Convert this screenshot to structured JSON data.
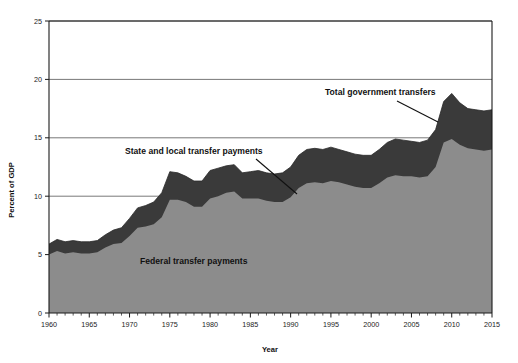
{
  "chart_data": {
    "type": "area",
    "stacked": true,
    "title": "",
    "subtitle": "",
    "xlabel": "Year",
    "ylabel": "Percent of GDP",
    "xlim": [
      1960,
      2015
    ],
    "ylim": [
      0,
      25
    ],
    "y_ticks": [
      0,
      5,
      10,
      15,
      20,
      25
    ],
    "x_ticks": [
      1960,
      1965,
      1970,
      1975,
      1980,
      1985,
      1990,
      1995,
      2000,
      2005,
      2010,
      2015
    ],
    "x_tick_labels": [
      "1960",
      "1965",
      "1970",
      "1975",
      "1980",
      "1985",
      "1990",
      "1995",
      "2000",
      "2005",
      "2010",
      "2015"
    ],
    "y_tick_labels": [
      "0",
      "5",
      "10",
      "15",
      "20",
      "25"
    ],
    "x_minor_tick_interval": 1,
    "grid": "horizontal",
    "legend": "inline-annotations",
    "colors": {
      "federal": "#8c8c8c",
      "state_local": "#3a3a3a",
      "axis": "#1a1a1a",
      "gridline": "#555555",
      "background": "#ffffff"
    },
    "x": [
      1960,
      1961,
      1962,
      1963,
      1964,
      1965,
      1966,
      1967,
      1968,
      1969,
      1970,
      1971,
      1972,
      1973,
      1974,
      1975,
      1976,
      1977,
      1978,
      1979,
      1980,
      1981,
      1982,
      1983,
      1984,
      1985,
      1986,
      1987,
      1988,
      1989,
      1990,
      1991,
      1992,
      1993,
      1994,
      1995,
      1996,
      1997,
      1998,
      1999,
      2000,
      2001,
      2002,
      2003,
      2004,
      2005,
      2006,
      2007,
      2008,
      2009,
      2010,
      2011,
      2012,
      2013,
      2014,
      2015
    ],
    "series": [
      {
        "name": "Federal transfer payments",
        "label": "Federal transfer payments",
        "color": "#8c8c8c",
        "values": [
          5.0,
          5.3,
          5.1,
          5.2,
          5.1,
          5.1,
          5.2,
          5.6,
          5.9,
          6.0,
          6.6,
          7.3,
          7.4,
          7.6,
          8.2,
          9.7,
          9.7,
          9.5,
          9.1,
          9.1,
          9.8,
          10.0,
          10.3,
          10.4,
          9.8,
          9.8,
          9.8,
          9.6,
          9.5,
          9.5,
          9.9,
          10.7,
          11.1,
          11.2,
          11.1,
          11.3,
          11.2,
          11.0,
          10.8,
          10.7,
          10.7,
          11.1,
          11.6,
          11.8,
          11.7,
          11.7,
          11.6,
          11.7,
          12.5,
          14.6,
          14.9,
          14.4,
          14.1,
          14.0,
          13.9,
          14.0
        ]
      },
      {
        "name": "State and local transfer payments",
        "label": "State and local transfer payments",
        "color": "#3a3a3a",
        "values": [
          0.9,
          1.0,
          1.0,
          1.0,
          1.0,
          1.0,
          1.0,
          1.1,
          1.2,
          1.3,
          1.5,
          1.7,
          1.8,
          1.9,
          2.1,
          2.4,
          2.3,
          2.2,
          2.2,
          2.2,
          2.4,
          2.4,
          2.3,
          2.3,
          2.2,
          2.3,
          2.4,
          2.4,
          2.4,
          2.5,
          2.6,
          2.8,
          2.9,
          2.9,
          2.9,
          2.9,
          2.8,
          2.8,
          2.8,
          2.8,
          2.8,
          2.9,
          3.0,
          3.1,
          3.1,
          3.0,
          3.0,
          3.1,
          3.2,
          3.5,
          3.9,
          3.6,
          3.4,
          3.4,
          3.4,
          3.4
        ]
      }
    ],
    "total_series": {
      "name": "Total government transfers",
      "label": "Total government transfers",
      "values": [
        5.9,
        6.3,
        6.1,
        6.2,
        6.1,
        6.1,
        6.2,
        6.7,
        7.1,
        7.3,
        8.1,
        9.0,
        9.2,
        9.5,
        10.3,
        12.1,
        12.0,
        11.7,
        11.3,
        11.3,
        12.2,
        12.4,
        12.6,
        12.7,
        12.0,
        12.1,
        12.2,
        12.0,
        11.9,
        12.0,
        12.5,
        13.5,
        14.0,
        14.1,
        14.0,
        14.2,
        14.0,
        13.8,
        13.6,
        13.5,
        13.5,
        14.0,
        14.6,
        14.9,
        14.8,
        14.7,
        14.6,
        14.8,
        15.7,
        18.1,
        18.8,
        18.0,
        17.5,
        17.4,
        17.3,
        17.4
      ]
    },
    "annotations": [
      {
        "id": "total-government-transfers",
        "text": "Total government transfers",
        "text_x": 325,
        "text_y": 95,
        "leader_from_x": 397,
        "leader_from_y": 101,
        "leader_to_x": 438,
        "leader_to_y": 122
      },
      {
        "id": "state-and-local-transfer-payments",
        "text": "State and local transfer payments",
        "text_x": 125,
        "text_y": 154,
        "leader_from_x": 256,
        "leader_from_y": 159,
        "leader_to_x": 297,
        "leader_to_y": 194
      },
      {
        "id": "federal-transfer-payments",
        "text": "Federal transfer payments",
        "text_x": 140,
        "text_y": 264,
        "leader_from_x": null,
        "leader_from_y": null,
        "leader_to_x": null,
        "leader_to_y": null
      }
    ]
  }
}
